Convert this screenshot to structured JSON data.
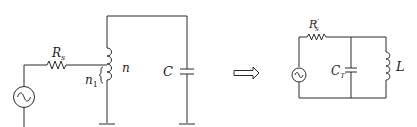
{
  "diagram": {
    "type": "circuit-equivalence",
    "colors": {
      "stroke": "#2a2a2a",
      "text": "#222222",
      "background": "#ffffff"
    },
    "left_circuit": {
      "source": {
        "kind": "ac-voltage-source",
        "icon": "sine-wave-source"
      },
      "resistor": {
        "label": "R",
        "subscript": "s"
      },
      "tapped_inductor": {
        "total_turns_label": "n",
        "tap_turns_label": "n",
        "tap_turns_subscript": "1"
      },
      "capacitor": {
        "label": "C"
      },
      "grounds": 3
    },
    "transform_arrow": {
      "icon": "double-right-arrow",
      "symbol": "⟹"
    },
    "right_circuit": {
      "source": {
        "kind": "ac-voltage-source",
        "icon": "sine-wave-source"
      },
      "resistor": {
        "label": "R",
        "prime": "′",
        "subscript": "s"
      },
      "capacitor": {
        "label": "C",
        "subscript": "T"
      },
      "inductor": {
        "label": "L"
      }
    }
  }
}
